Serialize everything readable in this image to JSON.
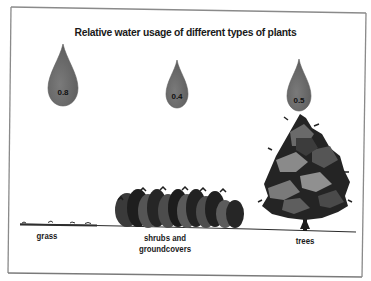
{
  "figure": {
    "title": "Relative water usage of different types of plants"
  },
  "plants": [
    {
      "name": "grass",
      "label": "grass",
      "water_usage": "0.8"
    },
    {
      "name": "shrubs",
      "label_line1": "shrubs and",
      "label_line2": "groundcovers",
      "water_usage": "0.4"
    },
    {
      "name": "trees",
      "label": "trees",
      "water_usage": "0.5"
    }
  ],
  "colors": {
    "drop_fill": "#6e6e6e",
    "drop_edge": "#555555",
    "ground_line": "#2a2a2a",
    "frame": "#777777",
    "foliage_dark": "#1e1e1e",
    "foliage_mid": "#4a4a4a",
    "foliage_light": "#8a8a8a"
  }
}
